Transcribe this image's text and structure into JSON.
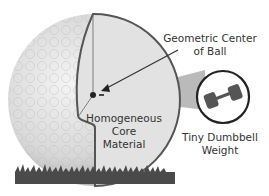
{
  "labels": {
    "center_line1": "Geometric Center",
    "center_line2": "of Ball",
    "core_line1": "Homogeneous",
    "core_line2": "Core",
    "core_line3": "Material",
    "weight_line1": "Tiny Dumbbell",
    "weight_line2": "Weight"
  },
  "colors": {
    "ball_shade": "#c8c8c8",
    "cutaway_fill": "#e2e2e2",
    "outline": "#555555",
    "grass": "#4a4a4a",
    "wedge": "#a9a9a9"
  }
}
